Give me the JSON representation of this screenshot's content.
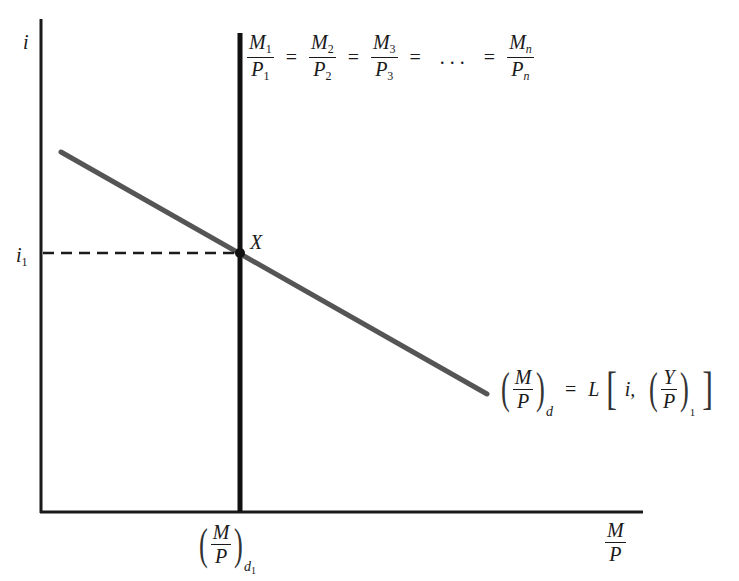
{
  "diagram": {
    "type": "money-market-equilibrium",
    "y_axis_label": "i",
    "x_axis_label": {
      "numerator": "M",
      "denominator": "P"
    },
    "interest_level": {
      "base": "i",
      "subscript": "1"
    },
    "equilibrium_point": "X",
    "supply_label": {
      "terms": [
        {
          "num": "M",
          "num_sub": "1",
          "den": "P",
          "den_sub": "1"
        },
        {
          "num": "M",
          "num_sub": "2",
          "den": "P",
          "den_sub": "2"
        },
        {
          "num": "M",
          "num_sub": "3",
          "den": "P",
          "den_sub": "3"
        },
        {
          "num": "M",
          "num_sub": "n",
          "den": "P",
          "den_sub": "n"
        }
      ],
      "equals": "=",
      "ellipsis": ". . ."
    },
    "demand_label": {
      "lhs_num": "M",
      "lhs_den": "P",
      "lhs_sub": "d",
      "equals": "=",
      "func": "L",
      "arg1": "i,",
      "arg2_num": "Y",
      "arg2_den": "P",
      "arg2_sub": "1"
    },
    "x_tick_label": {
      "num": "M",
      "den": "P",
      "sub": "d",
      "sub2": "1"
    },
    "colors": {
      "axis": "#1a1a1a",
      "supply_line": "#111111",
      "demand_line": "#555555",
      "dash": "#1a1a1a"
    }
  }
}
